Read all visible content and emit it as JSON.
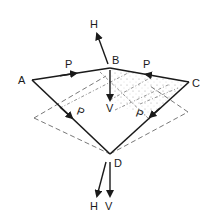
{
  "diagram": {
    "type": "force-diagram",
    "points": {
      "A": {
        "label": "A",
        "x": 32,
        "y": 80
      },
      "B": {
        "label": "B",
        "x": 110,
        "y": 68
      },
      "C": {
        "label": "C",
        "x": 189,
        "y": 82
      },
      "D": {
        "label": "D",
        "x": 110,
        "y": 154
      }
    },
    "edge_labels": {
      "AB": "P",
      "BC": "P",
      "AD": "P",
      "CD": "P"
    },
    "force_labels": {
      "B_horizontal": "H",
      "B_vertical": "V",
      "D_horizontal": "H",
      "D_vertical": "V"
    },
    "colors": {
      "line": "#1a1a1a",
      "dashed": "#555555"
    }
  }
}
